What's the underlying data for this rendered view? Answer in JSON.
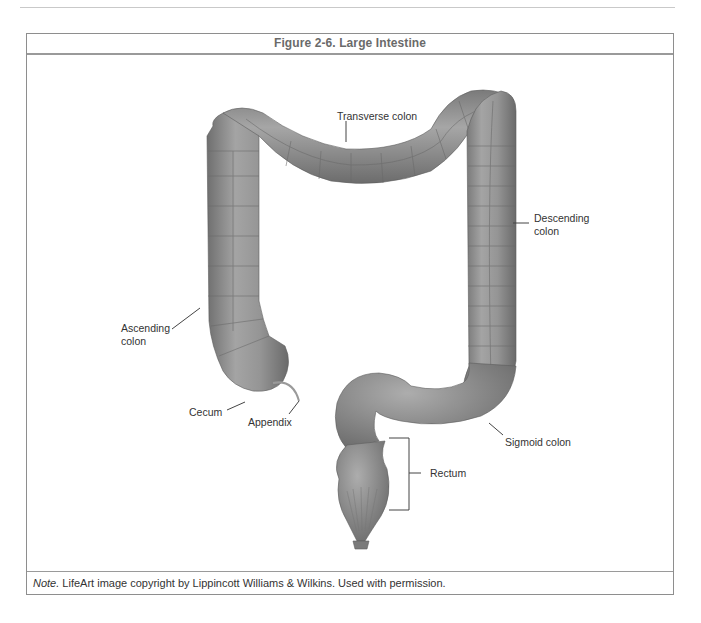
{
  "figure": {
    "title": "Figure 2-6. Large Intestine",
    "note_prefix": "Note.",
    "note_text": " LifeArt image copyright by Lippincott Williams & Wilkins. Used with permission."
  },
  "labels": {
    "transverse_colon": "Transverse colon",
    "descending_colon_line1": "Descending",
    "descending_colon_line2": "colon",
    "ascending_colon_line1": "Ascending",
    "ascending_colon_line2": "colon",
    "cecum": "Cecum",
    "appendix": "Appendix",
    "sigmoid_colon": "Sigmoid colon",
    "rectum": "Rectum"
  },
  "colors": {
    "tissue": "#8c8c8c",
    "tissue_light": "#a8a8a8",
    "tissue_dark": "#6e6e6e",
    "border": "#8e8e8e"
  }
}
